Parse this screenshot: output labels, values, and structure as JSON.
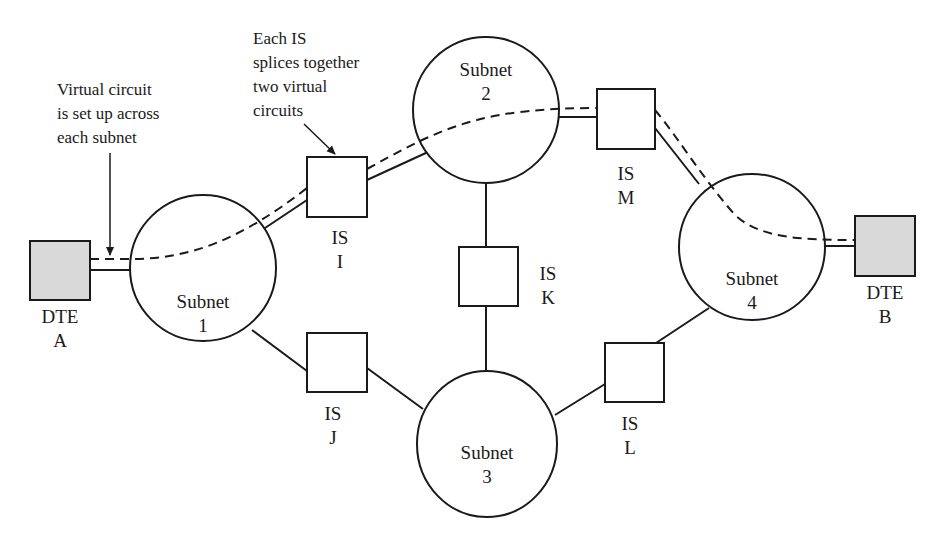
{
  "diagram": {
    "type": "network-topology",
    "colors": {
      "line": "#1a1a1a",
      "dte_fill": "#d9d9d9",
      "node_fill": "#ffffff",
      "background": "#ffffff"
    },
    "annotations": {
      "virtual_circuit": [
        "Virtual circuit",
        "is set up across",
        "each subnet"
      ],
      "is_splice": [
        "Each IS",
        "splices together",
        "two virtual",
        "circuits"
      ]
    },
    "dtes": [
      {
        "id": "A",
        "line1": "DTE",
        "line2": "A"
      },
      {
        "id": "B",
        "line1": "DTE",
        "line2": "B"
      }
    ],
    "subnets": [
      {
        "id": "1",
        "line1": "Subnet",
        "line2": "1"
      },
      {
        "id": "2",
        "line1": "Subnet",
        "line2": "2"
      },
      {
        "id": "3",
        "line1": "Subnet",
        "line2": "3"
      },
      {
        "id": "4",
        "line1": "Subnet",
        "line2": "4"
      }
    ],
    "intermediate_systems": [
      {
        "id": "I",
        "line1": "IS",
        "line2": "I"
      },
      {
        "id": "J",
        "line1": "IS",
        "line2": "J"
      },
      {
        "id": "K",
        "line1": "IS",
        "line2": "K"
      },
      {
        "id": "L",
        "line1": "IS",
        "line2": "L"
      },
      {
        "id": "M",
        "line1": "IS",
        "line2": "M"
      }
    ],
    "links": [
      [
        "DTE A",
        "Subnet 1"
      ],
      [
        "Subnet 1",
        "IS I"
      ],
      [
        "IS I",
        "Subnet 2"
      ],
      [
        "Subnet 2",
        "IS M"
      ],
      [
        "IS M",
        "Subnet 4"
      ],
      [
        "Subnet 4",
        "DTE B"
      ],
      [
        "Subnet 2",
        "IS K"
      ],
      [
        "IS K",
        "Subnet 3"
      ],
      [
        "Subnet 1",
        "IS J"
      ],
      [
        "IS J",
        "Subnet 3"
      ],
      [
        "Subnet 3",
        "IS L"
      ],
      [
        "IS L",
        "Subnet 4"
      ]
    ],
    "virtual_circuit_path": [
      "DTE A",
      "Subnet 1",
      "IS I",
      "Subnet 2",
      "IS M",
      "Subnet 4",
      "DTE B"
    ]
  }
}
